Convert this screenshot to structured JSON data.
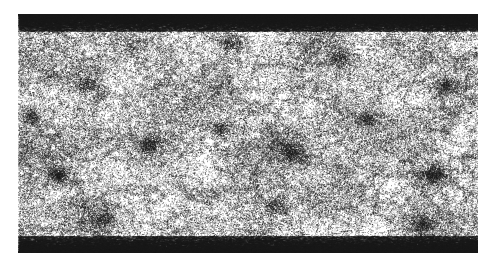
{
  "figure": {
    "kind": "all-sky-point-density-map",
    "background_color": "#ffffff",
    "width": 495,
    "height": 265,
    "title": "",
    "caption": ""
  },
  "panel": {
    "name": "sky-map-panel",
    "projection": "equirectangular",
    "x": 18,
    "y": 14,
    "width": 460,
    "height": 239,
    "frame_visible": false,
    "background_color": "#ffffff",
    "point_color": "#1a1a1a",
    "axis_labels_visible": false,
    "tick_labels_visible": false,
    "legend_visible": false,
    "colorbar_visible": false
  },
  "chart_data": {
    "type": "scatter",
    "title": "",
    "subtitle": "",
    "xlabel": "",
    "ylabel": "",
    "xlim": [
      0,
      360
    ],
    "ylim": [
      -90,
      90
    ],
    "grid": false,
    "legend_position": "none",
    "tick_labels_x": [],
    "tick_labels_y": [],
    "annotations": [],
    "marker": {
      "shape": "point",
      "size_px": 1.0,
      "color": "#1a1a1a",
      "opacity": 0.72
    },
    "point_count": 120000,
    "distribution": "clustered-isotropic-with-polar-compression",
    "series": [
      {
        "name": "sky-points",
        "color": "#1a1a1a",
        "n": 120000,
        "description": "near-uniform point field in equirectangular projection with clustered overdensities and dense pile-up bands at the poles"
      }
    ],
    "overdensities": [
      {
        "label": "central-knot",
        "x_frac": 0.595,
        "y_frac": 0.575,
        "radius_frac": 0.075,
        "strength": 1.0
      },
      {
        "label": "right-knot",
        "x_frac": 0.905,
        "y_frac": 0.672,
        "radius_frac": 0.068,
        "strength": 0.95
      },
      {
        "label": "left-knot",
        "x_frac": 0.088,
        "y_frac": 0.67,
        "radius_frac": 0.055,
        "strength": 0.8
      },
      {
        "label": "mid-left-clump",
        "x_frac": 0.285,
        "y_frac": 0.545,
        "radius_frac": 0.06,
        "strength": 0.72
      },
      {
        "label": "upper-right-clump",
        "x_frac": 0.7,
        "y_frac": 0.185,
        "radius_frac": 0.075,
        "strength": 0.68
      },
      {
        "label": "upper-left-clump",
        "x_frac": 0.15,
        "y_frac": 0.29,
        "radius_frac": 0.07,
        "strength": 0.62
      },
      {
        "label": "far-right-upper",
        "x_frac": 0.93,
        "y_frac": 0.3,
        "radius_frac": 0.062,
        "strength": 0.58
      },
      {
        "label": "lower-center",
        "x_frac": 0.56,
        "y_frac": 0.8,
        "radius_frac": 0.068,
        "strength": 0.62
      },
      {
        "label": "lower-right",
        "x_frac": 0.88,
        "y_frac": 0.88,
        "radius_frac": 0.055,
        "strength": 0.55
      },
      {
        "label": "mid-center-left",
        "x_frac": 0.44,
        "y_frac": 0.48,
        "radius_frac": 0.058,
        "strength": 0.45
      },
      {
        "label": "right-mid",
        "x_frac": 0.76,
        "y_frac": 0.44,
        "radius_frac": 0.06,
        "strength": 0.5
      },
      {
        "label": "lower-left",
        "x_frac": 0.18,
        "y_frac": 0.86,
        "radius_frac": 0.055,
        "strength": 0.45
      },
      {
        "label": "upper-center",
        "x_frac": 0.46,
        "y_frac": 0.12,
        "radius_frac": 0.06,
        "strength": 0.42
      },
      {
        "label": "far-left-mid",
        "x_frac": 0.03,
        "y_frac": 0.43,
        "radius_frac": 0.05,
        "strength": 0.4
      }
    ],
    "polar_bands": [
      {
        "label": "north-pole-band",
        "edge": "top",
        "thickness_frac": 0.03,
        "density_multiplier": 5.5
      },
      {
        "label": "south-pole-band",
        "edge": "bottom",
        "thickness_frac": 0.03,
        "density_multiplier": 5.0
      }
    ]
  }
}
